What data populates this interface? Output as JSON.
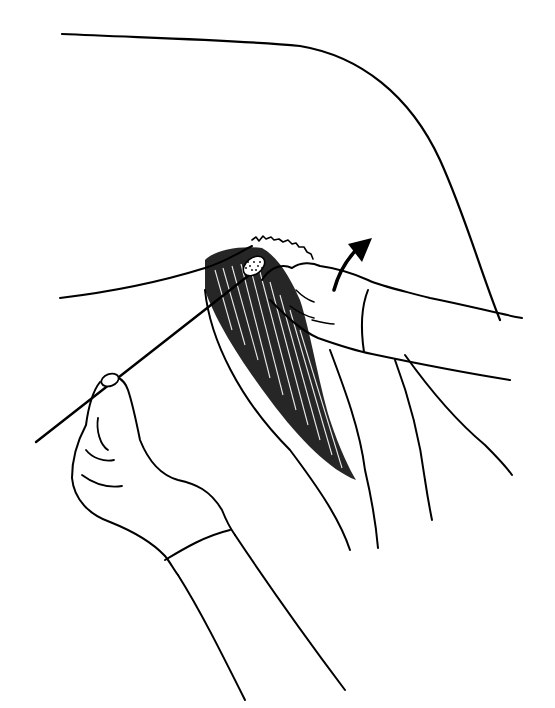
{
  "illustration": {
    "subject": "swab being inserted under a lifted tail with a gloved hand; second gloved hand holds the swab stick",
    "style": "black ink line drawing on white",
    "colors": {
      "background": "#ffffff",
      "ink": "#000000"
    },
    "elements": [
      "animal-body-outline",
      "lifted-tail",
      "gloved-hand-lifting-tail",
      "direction-arrow",
      "swab-stick",
      "swab-tip",
      "gloved-hand-holding-swab",
      "hatched-hindquarter-region"
    ]
  }
}
